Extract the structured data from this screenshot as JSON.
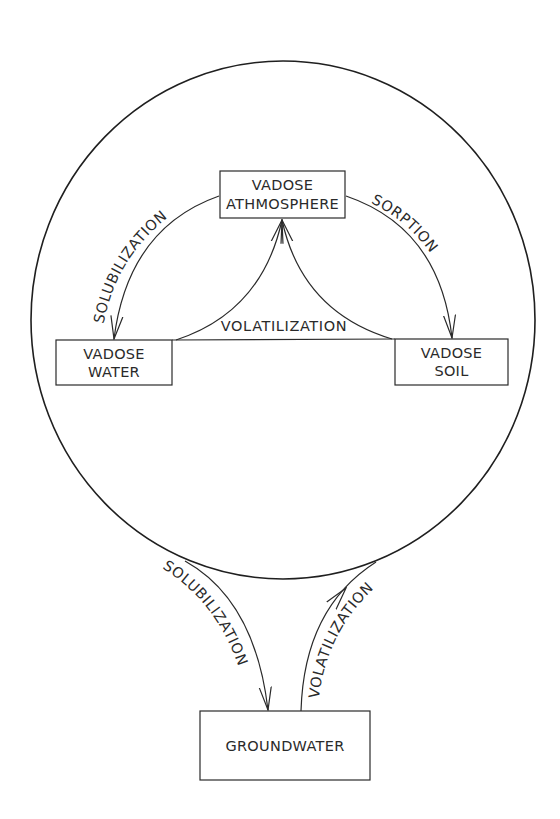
{
  "diagram": {
    "boundary": {
      "name": "vadose-zone-circle"
    },
    "nodes": {
      "vadose_atmosphere": {
        "line1": "VADOSE",
        "line2": "ATHMOSPHERE"
      },
      "vadose_water": {
        "line1": "VADOSE",
        "line2": "WATER"
      },
      "vadose_soil": {
        "line1": "VADOSE",
        "line2": "SOIL"
      },
      "groundwater": {
        "label": "GROUNDWATER"
      }
    },
    "edges": {
      "atm_to_water": {
        "label": "SOLUBILIZATION",
        "from": "VADOSE ATHMOSPHERE",
        "to": "VADOSE WATER"
      },
      "atm_to_soil": {
        "label": "SORPTION",
        "from": "VADOSE ATHMOSPHERE",
        "to": "VADOSE SOIL"
      },
      "water_soil_to_atm": {
        "label": "VOLATILIZATION",
        "from": "VADOSE WATER / VADOSE SOIL",
        "to": "VADOSE ATHMOSPHERE"
      },
      "vadose_to_groundwater": {
        "label": "SOLUBILIZATION",
        "from": "VADOSE ZONE",
        "to": "GROUNDWATER"
      },
      "groundwater_to_vadose": {
        "label": "VOLATILIZATION",
        "from": "GROUNDWATER",
        "to": "VADOSE ZONE"
      }
    },
    "colors": {
      "ink": "#2a2a2a",
      "background": "#ffffff"
    }
  }
}
